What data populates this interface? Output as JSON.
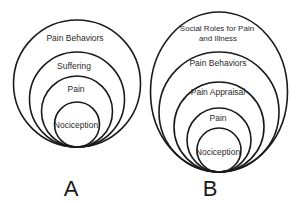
{
  "colors": {
    "background": "#ffffff",
    "stroke": "#1a1a1a",
    "text": "#2a2a2a"
  },
  "diagram_a": {
    "panel_label": "A",
    "rings": {
      "pain_behaviors": "Pain Behaviors",
      "suffering": "Suffering",
      "pain": "Pain",
      "nociception": "Nociception"
    }
  },
  "diagram_b": {
    "panel_label": "B",
    "rings": {
      "social_roles_line1": "Social Roles for Pain",
      "social_roles_line2": "and Illness",
      "pain_behaviors": "Pain Behaviors",
      "pain_appraisal": "Pain Appraisal",
      "pain": "Pain",
      "nociception": "Nociception"
    }
  }
}
